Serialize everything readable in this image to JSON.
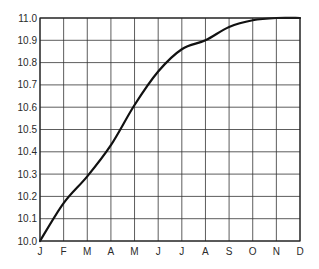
{
  "chart_data": {
    "type": "line",
    "title": "",
    "xlabel": "",
    "ylabel": "",
    "categories": [
      "J",
      "F",
      "M",
      "A",
      "M",
      "J",
      "J",
      "A",
      "S",
      "O",
      "N",
      "D"
    ],
    "series": [
      {
        "name": "value",
        "values": [
          10.0,
          10.17,
          10.29,
          10.43,
          10.61,
          10.76,
          10.86,
          10.9,
          10.96,
          10.99,
          11.0,
          11.0
        ]
      }
    ],
    "ylim": [
      10.0,
      11.0
    ],
    "yticks": [
      "10.0",
      "10.1",
      "10.2",
      "10.3",
      "10.4",
      "10.5",
      "10.6",
      "10.7",
      "10.8",
      "10.9",
      "11.0"
    ],
    "grid": true,
    "legend": null,
    "colors": {
      "line": "#111111",
      "grid": "#333333",
      "axis": "#222222",
      "background": "#ffffff"
    }
  }
}
